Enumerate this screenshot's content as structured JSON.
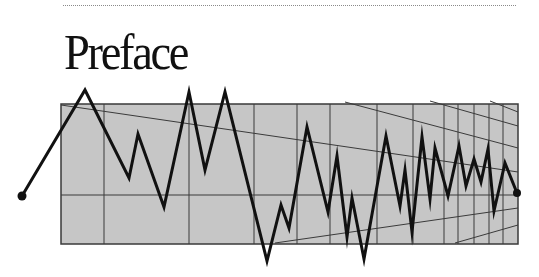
{
  "page": {
    "title": "Preface"
  },
  "colors": {
    "box_fill": "#c6c6c6",
    "grid_line": "#3a3a3a",
    "zigzag": "#111111"
  },
  "figure": {
    "box": {
      "x": 61,
      "y": 104,
      "width": 457,
      "height": 140
    },
    "vertical_lines_x": [
      104,
      189,
      254,
      297,
      330,
      377,
      413,
      444,
      458,
      474,
      489,
      503
    ],
    "horizontal_line_y": 195,
    "diagonals": [
      {
        "x1": 61,
        "y1": 105,
        "x2": 518,
        "y2": 172
      },
      {
        "x1": 345,
        "y1": 102,
        "x2": 518,
        "y2": 148
      },
      {
        "x1": 430,
        "y1": 101,
        "x2": 518,
        "y2": 126
      },
      {
        "x1": 490,
        "y1": 101,
        "x2": 518,
        "y2": 112
      },
      {
        "x1": 275,
        "y1": 243,
        "x2": 518,
        "y2": 208
      },
      {
        "x1": 455,
        "y1": 243,
        "x2": 518,
        "y2": 225
      }
    ],
    "zigzag_points": [
      [
        22,
        196
      ],
      [
        85,
        90
      ],
      [
        129,
        178
      ],
      [
        138,
        134
      ],
      [
        164,
        207
      ],
      [
        189,
        92
      ],
      [
        205,
        170
      ],
      [
        225,
        92
      ],
      [
        267,
        261
      ],
      [
        281,
        205
      ],
      [
        289,
        228
      ],
      [
        307,
        127
      ],
      [
        328,
        212
      ],
      [
        337,
        156
      ],
      [
        347,
        237
      ],
      [
        352,
        198
      ],
      [
        364,
        259
      ],
      [
        386,
        136
      ],
      [
        400,
        206
      ],
      [
        405,
        170
      ],
      [
        412,
        232
      ],
      [
        422,
        137
      ],
      [
        430,
        199
      ],
      [
        435,
        148
      ],
      [
        448,
        196
      ],
      [
        459,
        146
      ],
      [
        466,
        186
      ],
      [
        474,
        159
      ],
      [
        481,
        182
      ],
      [
        488,
        149
      ],
      [
        494,
        211
      ],
      [
        505,
        163
      ],
      [
        517,
        193
      ]
    ],
    "start_dot": [
      22,
      196
    ],
    "end_dot": [
      517,
      193
    ]
  }
}
